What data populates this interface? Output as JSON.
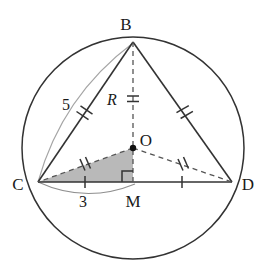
{
  "figure": {
    "type": "circle-geometry-diagram",
    "background_color": "#ffffff",
    "stroke_color": "#333333",
    "dashed_color": "#555555",
    "construction_arc_color": "#9a9a9a",
    "shade_color": "#b5b5b5",
    "labels": {
      "point_b": "B",
      "point_c": "C",
      "point_d": "D",
      "point_o": "O",
      "point_m": "M",
      "radius": "R",
      "chord_bc_length": "5",
      "segment_cm_length": "3"
    },
    "points": {
      "B": {
        "x": 133,
        "y": 42
      },
      "C": {
        "x": 38,
        "y": 182
      },
      "D": {
        "x": 232,
        "y": 182
      },
      "O": {
        "x": 133,
        "y": 148
      },
      "M": {
        "x": 133,
        "y": 182
      }
    },
    "circle": {
      "cx": 133,
      "cy": 148,
      "r": 111
    },
    "segments": [
      {
        "name": "chord-BC",
        "from": "B",
        "to": "C",
        "style": "solid",
        "ticks": 2
      },
      {
        "name": "chord-BD",
        "from": "B",
        "to": "D",
        "style": "solid",
        "ticks": 2
      },
      {
        "name": "chord-CD",
        "from": "C",
        "to": "D",
        "style": "solid",
        "ticks": 0
      },
      {
        "name": "radius-BM",
        "from": "B",
        "to": "M",
        "style": "dashed",
        "ticks": 2
      },
      {
        "name": "radius-OC",
        "from": "O",
        "to": "C",
        "style": "dashed",
        "ticks": 2
      },
      {
        "name": "radius-OD",
        "from": "O",
        "to": "D",
        "style": "dashed",
        "ticks": 2
      },
      {
        "name": "segment-CM",
        "from": "C",
        "to": "M",
        "style": "solid",
        "ticks": 1
      },
      {
        "name": "segment-MD",
        "from": "M",
        "to": "D",
        "style": "solid",
        "ticks": 1
      }
    ],
    "right_angle": {
      "at": "M",
      "size": 11
    },
    "shaded_triangle": {
      "vertices": [
        "C",
        "O",
        "M"
      ],
      "fill": "#b5b5b5"
    },
    "construction_arcs": [
      {
        "name": "arc-cb-length-5",
        "from": "C",
        "to": "B"
      },
      {
        "name": "arc-cm-length-3",
        "from": "C",
        "to": "M"
      }
    ]
  }
}
